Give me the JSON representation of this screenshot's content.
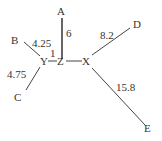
{
  "diagram": {
    "type": "phylogenetic-tree",
    "internal_nodes": [
      {
        "id": "Y",
        "label": "Y",
        "x": 43,
        "y": 65
      },
      {
        "id": "Z",
        "label": "Z",
        "x": 61,
        "y": 65
      },
      {
        "id": "X",
        "label": "X",
        "x": 86,
        "y": 65
      }
    ],
    "leaves": [
      {
        "id": "A",
        "label": "A",
        "x": 61,
        "y": 15
      },
      {
        "id": "B",
        "label": "B",
        "x": 15,
        "y": 44
      },
      {
        "id": "C",
        "label": "C",
        "x": 18,
        "y": 101
      },
      {
        "id": "D",
        "label": "D",
        "x": 137,
        "y": 28
      },
      {
        "id": "E",
        "label": "E",
        "x": 148,
        "y": 132
      }
    ],
    "edges": [
      {
        "from": "Z",
        "to": "A",
        "length": "6",
        "label_x": 67,
        "label_y": 37
      },
      {
        "from": "Y",
        "to": "B",
        "length": "4.25",
        "label_x": 32,
        "label_y": 47
      },
      {
        "from": "Y",
        "to": "C",
        "length": "4.75",
        "label_x": 7,
        "label_y": 78
      },
      {
        "from": "Y",
        "to": "Z",
        "length": "1",
        "label_x": 51,
        "label_y": 57
      },
      {
        "from": "Z",
        "to": "X",
        "length": "",
        "label_x": 0,
        "label_y": 0
      },
      {
        "from": "X",
        "to": "D",
        "length": "8.2",
        "label_x": 101,
        "label_y": 39
      },
      {
        "from": "X",
        "to": "E",
        "length": "15.8",
        "label_x": 117,
        "label_y": 91
      }
    ]
  }
}
